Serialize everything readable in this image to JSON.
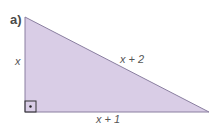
{
  "part_label": "a)",
  "triangle": {
    "fill": "#d9cde6",
    "stroke": "#8a7fa0",
    "sides": {
      "vertical": "x",
      "horizontal": "x + 1",
      "hypotenuse": "x + 2"
    },
    "right_angle_marker": true
  }
}
